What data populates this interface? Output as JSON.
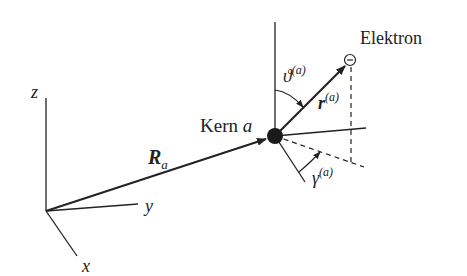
{
  "diagram": {
    "type": "coordinate-geometry",
    "global_axes": {
      "x": "x",
      "y": "y",
      "z": "z"
    },
    "vectors": {
      "nucleus_position": {
        "symbol": "R",
        "subscript": "a"
      },
      "electron_position": {
        "symbol": "r",
        "superscript": "(a)"
      }
    },
    "angles": {
      "polar": {
        "symbol": "ϑ",
        "superscript": "(a)"
      },
      "azimuthal": {
        "symbol": "γ",
        "superscript": "(a)"
      }
    },
    "labels": {
      "nucleus": "Kern",
      "nucleus_index": "a",
      "electron": "Elektron",
      "electron_symbol": "⊖"
    },
    "colors": {
      "line": "#222222",
      "background": "#ffffff"
    }
  }
}
